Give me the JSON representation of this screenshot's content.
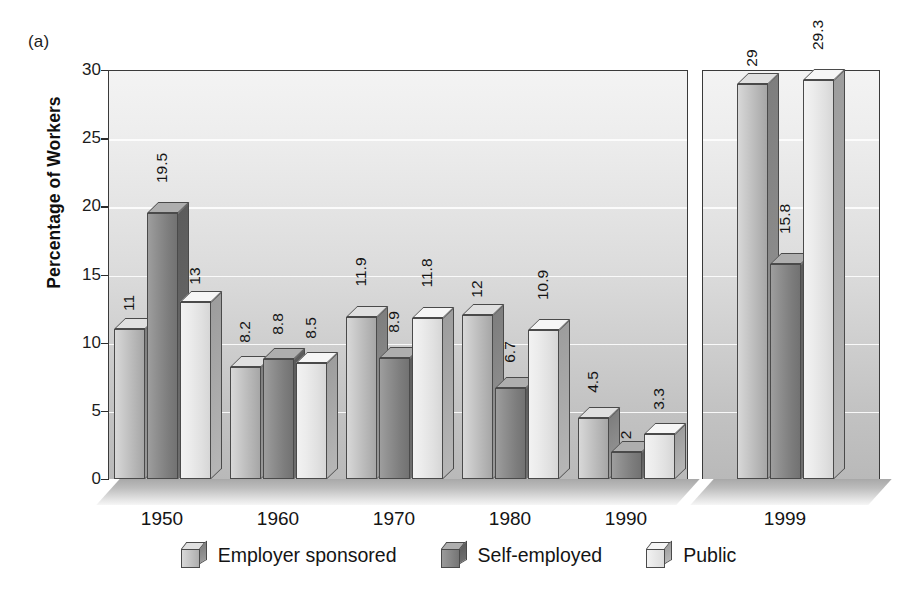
{
  "figure": {
    "panel_label": "(a)",
    "ylabel": "Percentage of Workers"
  },
  "legend": {
    "items": [
      {
        "label": "Employer sponsored",
        "key": "employer",
        "color": "#c0c0c0"
      },
      {
        "label": "Self-employed",
        "key": "self",
        "color": "#818181"
      },
      {
        "label": "Public",
        "key": "public",
        "color": "#e8e8e8"
      }
    ]
  },
  "yticks": [
    "0",
    "5",
    "10",
    "15",
    "20",
    "25",
    "30"
  ],
  "xlabels": [
    "1950",
    "1960",
    "1970",
    "1980",
    "1990",
    "1999"
  ],
  "chart_data": {
    "type": "bar",
    "title": "(a)",
    "xlabel": "",
    "ylabel": "Percentage of Workers",
    "ylim": [
      0,
      30
    ],
    "yticks": [
      0,
      5,
      10,
      15,
      20,
      25,
      30
    ],
    "grid": true,
    "legend_position": "bottom",
    "axis_break": {
      "after_category": "1990",
      "note": "panel split between 1990 and 1999"
    },
    "categories": [
      "1950",
      "1960",
      "1970",
      "1980",
      "1990",
      "1999"
    ],
    "series": [
      {
        "name": "Employer sponsored",
        "values": [
          11,
          8.2,
          11.9,
          12,
          4.5,
          29
        ]
      },
      {
        "name": "Self-employed",
        "values": [
          19.5,
          8.8,
          8.9,
          6.7,
          2,
          15.8
        ]
      },
      {
        "name": "Public",
        "values": [
          13,
          8.5,
          11.8,
          10.9,
          3.3,
          29.3
        ]
      }
    ],
    "value_labels": {
      "1950": [
        "11",
        "19.5",
        "13"
      ],
      "1960": [
        "8.2",
        "8.8",
        "8.5"
      ],
      "1970": [
        "11.9",
        "8.9",
        "11.8"
      ],
      "1980": [
        "12",
        "6.7",
        "10.9"
      ],
      "1990": [
        "4.5",
        "2",
        "3.3"
      ],
      "1999": [
        "29",
        "15.8",
        "29.3"
      ]
    }
  }
}
